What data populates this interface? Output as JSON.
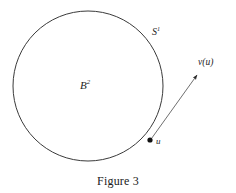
{
  "figure": {
    "caption": "Figure 3",
    "background_color": "#ffffff",
    "stroke_color": "#3a3a3a",
    "label_color": "#242424",
    "width": 236,
    "height": 193
  },
  "diagram": {
    "circle": {
      "name": "unit-circle",
      "center_x": 88,
      "center_y": 86,
      "radius": 75,
      "stroke_width": 1
    },
    "boundary_label": {
      "base": "S",
      "superscript": "1",
      "x": 152,
      "y": 27
    },
    "interior_label": {
      "base": "B",
      "superscript": "2",
      "x": 80,
      "y": 80
    },
    "point": {
      "name": "boundary-point-u",
      "label": "u",
      "x": 150,
      "y": 140,
      "radius": 2.6
    },
    "vector": {
      "name": "vector-v-of-u",
      "label": "v(u)",
      "from_x": 150,
      "from_y": 140,
      "to_x": 200,
      "to_y": 72,
      "stroke_width": 0.8
    }
  }
}
